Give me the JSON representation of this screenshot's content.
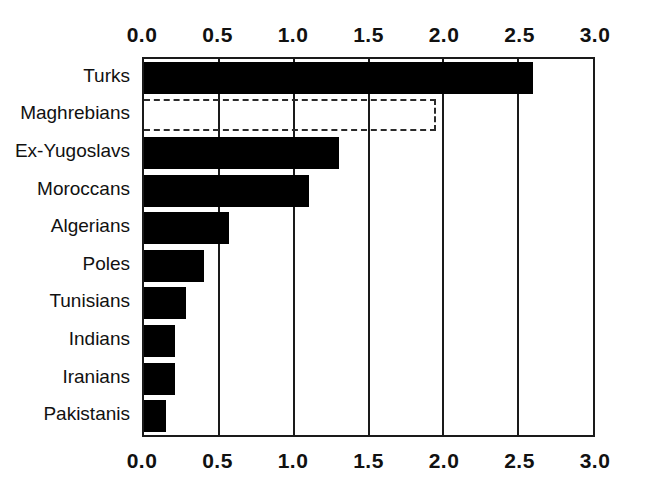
{
  "chart_data": {
    "type": "bar",
    "orientation": "horizontal",
    "title": "",
    "subtitle": "",
    "xlabel": "",
    "ylabel": "",
    "xlim": [
      0.0,
      3.0
    ],
    "grid": true,
    "legend": null,
    "axis_top": true,
    "axis_bottom": true,
    "tick_labels": [
      "0.0",
      "0.5",
      "1.0",
      "1.5",
      "2.0",
      "2.5",
      "3.0"
    ],
    "ticks": [
      0.0,
      0.5,
      1.0,
      1.5,
      2.0,
      2.5,
      3.0
    ],
    "categories": [
      "Turks",
      "Maghrebians",
      "Ex-Yugoslavs",
      "Moroccans",
      "Algerians",
      "Poles",
      "Tunisians",
      "Indians",
      "Iranians",
      "Pakistanis"
    ],
    "values": [
      2.6,
      1.95,
      1.3,
      1.1,
      0.57,
      0.4,
      0.28,
      0.21,
      0.21,
      0.15
    ],
    "bar_styles": [
      "solid",
      "dashed",
      "solid",
      "solid",
      "solid",
      "solid",
      "solid",
      "solid",
      "solid",
      "solid"
    ],
    "colors": {
      "bar_fill": "#000000",
      "bar_outline_dashed": "#2b2b2b",
      "axis": "#1a1a1a",
      "background": "#ffffff",
      "text": "#111111"
    }
  }
}
